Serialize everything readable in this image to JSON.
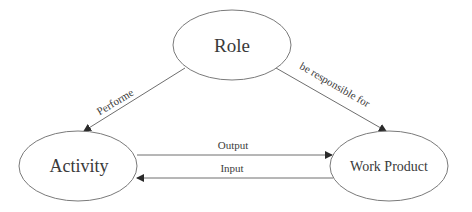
{
  "diagram": {
    "nodes": {
      "role": {
        "label": "Role"
      },
      "activity": {
        "label": "Activity"
      },
      "work_product": {
        "label": "Work Product"
      }
    },
    "edges": {
      "performe": {
        "from": "Role",
        "to": "Activity",
        "label": "Performe"
      },
      "responsible": {
        "from": "Role",
        "to": "Work Product",
        "label": "be responsible for"
      },
      "output": {
        "from": "Activity",
        "to": "Work Product",
        "label": "Output"
      },
      "input": {
        "from": "Work Product",
        "to": "Activity",
        "label": "Input"
      }
    },
    "colors": {
      "stroke": "#7a7a7a",
      "text": "#3a3a3a",
      "background": "#ffffff"
    }
  }
}
